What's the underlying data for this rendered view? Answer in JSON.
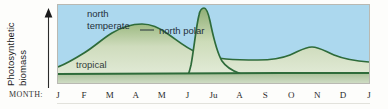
{
  "axes": {
    "y_label_line1": "Photosynthetic",
    "y_label_line2": "biomass",
    "y_arrow_icon": "up-arrow-icon",
    "month_label": "MONTH:"
  },
  "annotations": {
    "north_temperate": "north\ntemperate",
    "north_temperate_line1": "north",
    "north_temperate_line2": "temperate",
    "north_polar": "north polar",
    "tropical": "tropical"
  },
  "colors": {
    "sky": "#acd8ee",
    "curve_stroke": "#2e6b3a",
    "fill_light": "#dbe6cc",
    "fill_mid": "#b9cda3",
    "fill_deep": "#7ea46b",
    "tropical_band": "#9fba93",
    "frame": "#b9b9b2",
    "text": "#24303a"
  },
  "chart_data": {
    "type": "area",
    "title": "",
    "xlabel": "MONTH:",
    "ylabel": "Photosynthetic biomass",
    "grid": false,
    "legend": "inline-annotations",
    "categories": [
      "J",
      "F",
      "M",
      "A",
      "M",
      "J",
      "Ju",
      "A",
      "S",
      "O",
      "N",
      "D",
      "J"
    ],
    "x_tick_labels": [
      "J",
      "F",
      "M",
      "A",
      "M",
      "J",
      "Ju",
      "A",
      "S",
      "O",
      "N",
      "D",
      "J"
    ],
    "ylim": [
      0,
      100
    ],
    "y_ticks": [],
    "series": [
      {
        "name": "north temperate",
        "label": "north temperate",
        "note": "broad spring bloom peaking in April, decline through summer, small secondary autumn bloom near October",
        "values": [
          18,
          30,
          48,
          62,
          58,
          46,
          38,
          33,
          30,
          34,
          26,
          20,
          18
        ]
      },
      {
        "name": "north polar",
        "label": "north polar",
        "note": "sharp narrow midsummer spike peaking in July, near zero the rest of the year",
        "values": [
          0,
          0,
          0,
          0,
          1,
          6,
          95,
          40,
          18,
          8,
          3,
          1,
          0
        ]
      },
      {
        "name": "tropical",
        "label": "tropical",
        "note": "low and nearly constant all year",
        "values": [
          9,
          9,
          9,
          9,
          9,
          9,
          9,
          9,
          9,
          9,
          9,
          9,
          9
        ]
      }
    ]
  }
}
